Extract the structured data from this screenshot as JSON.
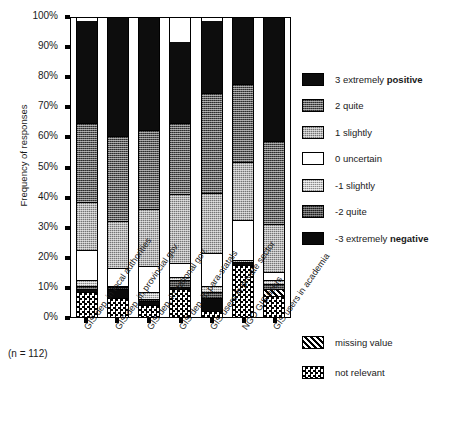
{
  "title_strip": "",
  "axis": {
    "ylabel": "Frequency of responses",
    "yticks": [
      "100%",
      "90%",
      "80%",
      "70%",
      "60%",
      "50%",
      "40%",
      "30%",
      "20%",
      "10%",
      "0%"
    ],
    "note": "(n = 112)"
  },
  "legend": {
    "items": [
      {
        "key": "pos3",
        "label_plain": "3 extremely ",
        "label_bold": "positive",
        "swatch": "p-pos3"
      },
      {
        "key": "q2",
        "label_plain": "2 quite",
        "label_bold": "",
        "swatch": "p-q2"
      },
      {
        "key": "s1",
        "label_plain": "1 slightly",
        "label_bold": "",
        "swatch": "p-s1"
      },
      {
        "key": "u0",
        "label_plain": "0 uncertain",
        "label_bold": "",
        "swatch": "p-u0"
      },
      {
        "key": "sn1",
        "label_plain": "-1 slightly",
        "label_bold": "",
        "swatch": "p-sn1"
      },
      {
        "key": "qn2",
        "label_plain": "-2 quite",
        "label_bold": "",
        "swatch": "p-qn2"
      },
      {
        "key": "neg3",
        "label_plain": "-3 extremely ",
        "label_bold": "negative",
        "swatch": "p-neg3"
      }
    ],
    "extra": [
      {
        "key": "missing",
        "label_plain": "missing value",
        "label_bold": "",
        "swatch": "p-missing"
      },
      {
        "key": "notrel",
        "label_plain": "not relevant",
        "label_bold": "",
        "swatch": "p-notrel"
      }
    ]
  },
  "chart_data": {
    "type": "bar",
    "subtype": "stacked-percentage",
    "title": "",
    "xlabel": "",
    "ylabel": "Frequency of responses",
    "ylim": [
      0,
      100
    ],
    "yticks": [
      0,
      10,
      20,
      30,
      40,
      50,
      60,
      70,
      80,
      90,
      100
    ],
    "grid": false,
    "legend_position": "right",
    "n": 112,
    "note": "(n = 112)",
    "categories": [
      "GIS dep. in local authorities",
      "GIS dep. in provincial gov.",
      "GIS dep. in national gov.",
      "GIS dep. in para-statals",
      "GIS users in private sector",
      "NGO GIS users",
      "GIS users in academia"
    ],
    "series": [
      {
        "name": "not relevant",
        "key": "notrel",
        "values": [
          8.5,
          6.5,
          4.0,
          9.5,
          2.0,
          17.5,
          7.0
        ]
      },
      {
        "name": "missing value",
        "key": "missing",
        "values": [
          0.0,
          0.0,
          0.0,
          0.0,
          0.0,
          0.0,
          2.5
        ]
      },
      {
        "name": "-3 extremely negative",
        "key": "neg3",
        "values": [
          1.0,
          3.0,
          1.5,
          0.5,
          4.5,
          1.0,
          0.0
        ]
      },
      {
        "name": "-2 quite",
        "key": "qn2",
        "values": [
          1.0,
          0.5,
          0.5,
          2.5,
          2.0,
          0.0,
          1.5
        ]
      },
      {
        "name": "-1 slightly",
        "key": "sn1",
        "values": [
          2.0,
          0.5,
          2.5,
          1.0,
          2.0,
          0.5,
          1.5
        ]
      },
      {
        "name": "0 uncertain",
        "key": "u0",
        "values": [
          10.0,
          6.0,
          8.5,
          4.5,
          11.0,
          13.5,
          2.5
        ]
      },
      {
        "name": "1 slightly",
        "key": "s1",
        "values": [
          16.0,
          15.5,
          19.0,
          23.0,
          20.0,
          19.5,
          16.0
        ]
      },
      {
        "name": "2 quite",
        "key": "q2",
        "values": [
          26.5,
          28.5,
          26.5,
          24.0,
          33.5,
          26.0,
          28.0
        ]
      },
      {
        "name": "3 extremely positive",
        "key": "pos3",
        "values": [
          34.0,
          39.5,
          37.5,
          27.0,
          24.0,
          22.0,
          41.0
        ]
      }
    ]
  }
}
